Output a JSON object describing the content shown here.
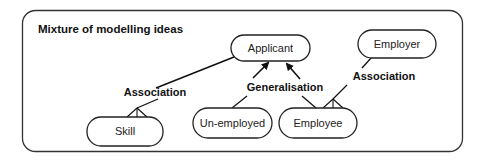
{
  "diagram": {
    "title": "Mixture of modelling  ideas",
    "nodes": [
      {
        "id": "applicant",
        "label": "Applicant"
      },
      {
        "id": "employer",
        "label": "Employer"
      },
      {
        "id": "skill",
        "label": "Skill"
      },
      {
        "id": "unemployed",
        "label": "Un-employed"
      },
      {
        "id": "employee",
        "label": "Employee"
      }
    ],
    "relations": [
      {
        "label": "Association",
        "from": "applicant",
        "to": "skill",
        "type": "association"
      },
      {
        "label": "Generalisation",
        "from": "unemployed",
        "to": "applicant",
        "type": "generalisation"
      },
      {
        "label": "Generalisation",
        "from": "employee",
        "to": "applicant",
        "type": "generalisation"
      },
      {
        "label": "Association",
        "from": "employer",
        "to": "employee",
        "type": "association"
      }
    ],
    "colors": {
      "stroke": "#222222",
      "background": "#ffffff"
    }
  }
}
